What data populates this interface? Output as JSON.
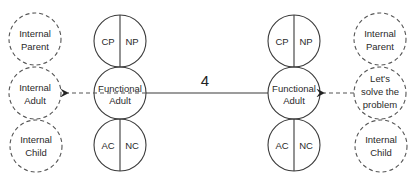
{
  "diagram": {
    "left_internal": {
      "parent": [
        "Internal",
        "Parent"
      ],
      "adult": [
        "Internal",
        "Adult"
      ],
      "child": [
        "Internal",
        "Child"
      ]
    },
    "left_functional": {
      "parent_left": "CP",
      "parent_right": "NP",
      "adult": [
        "Functional",
        "Adult"
      ],
      "child_left": "AC",
      "child_right": "NC"
    },
    "connector_label": "4",
    "right_functional": {
      "parent_left": "CP",
      "parent_right": "NP",
      "adult": [
        "Functional",
        "Adult"
      ],
      "child_left": "AC",
      "child_right": "NC"
    },
    "right_internal": {
      "parent": [
        "Internal",
        "Parent"
      ],
      "adult": [
        "Let's",
        "solve the",
        "problem"
      ],
      "child": [
        "Internal",
        "Child"
      ]
    },
    "colors": {
      "line": "#3a3a3a",
      "dashed": "#555555",
      "text": "#2a2a2a"
    }
  }
}
